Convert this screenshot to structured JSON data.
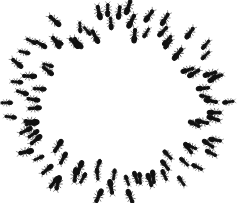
{
  "image": {
    "subject": "ant-mill",
    "description": "Black silhouettes of many ants walking in a circular ring (ant mill) on a white background",
    "background": "#ffffff",
    "ant_color": "#111111",
    "ring": {
      "cx": 118,
      "cy": 102,
      "rx": 96,
      "ry": 82,
      "thickness": 34
    },
    "ant_count": 90
  }
}
